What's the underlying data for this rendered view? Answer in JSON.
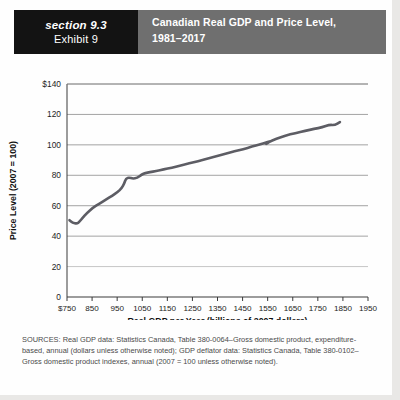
{
  "header": {
    "section_label": "section 9.3",
    "exhibit_label": "Exhibit 9",
    "title_line1": "Canadian Real GDP and Price Level,",
    "title_line2": "1981–2017",
    "section_bg": "#131313",
    "title_bg": "#6f6f6f"
  },
  "sources": {
    "text": "SOURCES: Real GDP data: Statistics Canada, Table 380-0064–Gross domestic product, expenditure-based, annual (dollars unless otherwise noted); GDP deflator data: Statistics Canada, Table 380-0102–Gross domestic product indexes, annual (2007 = 100 unless otherwise noted)."
  },
  "chart_data": {
    "type": "line",
    "title": "Canadian Real GDP and Price Level, 1981–2017",
    "xlabel": "Real GDP per Year (billions of 2007 dollars)",
    "ylabel": "Price Level (2007 = 100)",
    "xlim": [
      750,
      1950
    ],
    "ylim": [
      0,
      140
    ],
    "xticks": [
      750,
      850,
      950,
      1050,
      1150,
      1250,
      1350,
      1450,
      1550,
      1650,
      1750,
      1850,
      1950
    ],
    "xtick_labels": [
      "$750",
      "850",
      "950",
      "1050",
      "1150",
      "1250",
      "1350",
      "1450",
      "1550",
      "1650",
      "1750",
      "1850",
      "1950"
    ],
    "yticks": [
      0,
      20,
      40,
      60,
      80,
      100,
      120,
      140
    ],
    "ytick_labels": [
      "0",
      "20",
      "40",
      "60",
      "80",
      "100",
      "120",
      "$140"
    ],
    "grid": "horizontal",
    "legend": "none",
    "line_color": "#5d5d64",
    "series": [
      {
        "name": "Canadian Real GDP and Price Level",
        "x": [
          760,
          772,
          790,
          800,
          812,
          828,
          852,
          880,
          905,
          930,
          952,
          968,
          978,
          985,
          998,
          1012,
          1030,
          1048,
          1062,
          1080,
          1105,
          1135,
          1168,
          1200,
          1238,
          1272,
          1308,
          1345,
          1382,
          1418,
          1452,
          1488,
          1518,
          1545,
          1562,
          1540,
          1552,
          1585,
          1620,
          1660,
          1700,
          1735,
          1768,
          1795,
          1818,
          1838
        ],
        "y": [
          50.5,
          48.8,
          48.2,
          49.5,
          52.0,
          55.0,
          58.5,
          61.5,
          64.0,
          66.5,
          69.0,
          71.5,
          74.5,
          78.0,
          78.5,
          77.8,
          78.2,
          80.5,
          81.5,
          82.0,
          82.8,
          83.8,
          85.0,
          86.3,
          87.8,
          89.2,
          90.8,
          92.5,
          94.2,
          95.8,
          97.2,
          98.8,
          100.2,
          101.5,
          102.5,
          100.2,
          101.8,
          104.0,
          106.0,
          107.8,
          109.2,
          110.5,
          111.5,
          113.2,
          113.0,
          115.0
        ]
      }
    ]
  }
}
